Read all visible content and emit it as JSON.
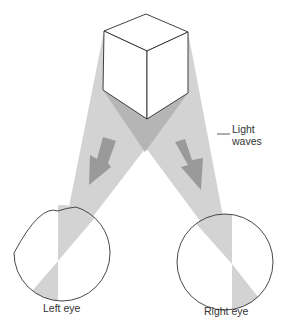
{
  "diagram": {
    "labels": {
      "light_waves_line1": "Light",
      "light_waves_line2": "waves",
      "left_eye": "Left eye",
      "right_eye": "Right eye"
    },
    "colors": {
      "beam": "#d3d3d3",
      "beam_overlap": "#b5b5b5",
      "arrow": "#9a9a9a",
      "outline": "#333333",
      "cube_face": "#ffffff"
    },
    "elements": [
      "cube",
      "left-light-beam",
      "right-light-beam",
      "left-arrow",
      "right-arrow",
      "left-eye",
      "right-eye"
    ]
  }
}
